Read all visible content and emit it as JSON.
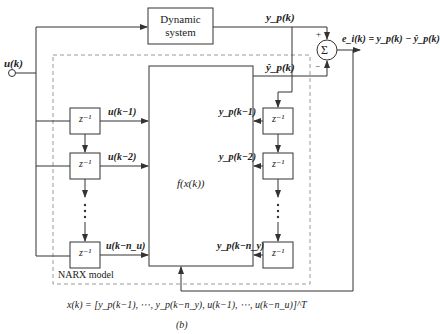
{
  "diagram": {
    "caption": "(b)",
    "input_label": "u(k)",
    "dynamic_system": {
      "line1": "Dynamic",
      "line2": "system"
    },
    "narx_label": "NARX model",
    "function_block": "f(x(k))",
    "delay_label": "z⁻¹",
    "sum_symbol": "Σ",
    "sum_plus": "+",
    "sum_minus": "−",
    "plant_output": "y_p(k)",
    "model_output": "ŷ_p(k)",
    "error_eq": "e_i(k) = y_p(k) − ŷ_p(k)",
    "left_taps": [
      "u(k−1)",
      "u(k−2)",
      "u(k−n_u)"
    ],
    "right_taps": [
      "y_p(k−1)",
      "y_p(k−2)",
      "y_p(k−n_y)"
    ],
    "regressor_eq": "x(k) = [y_p(k−1), ⋯, y_p(k−n_y), u(k−1), ⋯, u(k−n_u)]^T",
    "colors": {
      "line": "#333333",
      "dashed": "#9a9a9a",
      "background": "#ffffff"
    }
  }
}
